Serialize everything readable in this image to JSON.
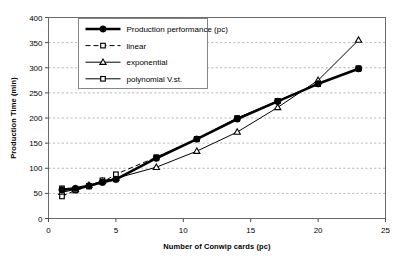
{
  "chart_data": {
    "type": "line",
    "title": "",
    "xlabel": "Number of Conwip cards (pc)",
    "ylabel": "Production Time (min)",
    "xlim": [
      0,
      25
    ],
    "ylim": [
      0,
      400
    ],
    "xticks": [
      0,
      5,
      10,
      15,
      20,
      25
    ],
    "yticks": [
      0,
      50,
      100,
      150,
      200,
      250,
      300,
      350,
      400
    ],
    "grid": "horizontal-dashed",
    "legend_position": "top-left-inside",
    "x": [
      1,
      2,
      3,
      4,
      5,
      8,
      11,
      14,
      17,
      20,
      23
    ],
    "series": [
      {
        "name": "Production performance (pc)",
        "marker": "filled-circle",
        "line": "thick-solid",
        "color": "#000000",
        "values": [
          57,
          60,
          65,
          72,
          78,
          120,
          158,
          198,
          233,
          268,
          298
        ]
      },
      {
        "name": "linear",
        "marker": "open-square",
        "line": "dashed",
        "color": "#000000",
        "values": [
          44,
          56,
          64,
          72,
          88,
          122,
          158,
          198,
          234,
          268,
          299
        ]
      },
      {
        "name": "exponential",
        "marker": "open-triangle",
        "line": "thin-solid",
        "color": "#000000",
        "values": [
          52,
          58,
          66,
          74,
          80,
          102,
          134,
          172,
          221,
          275,
          355
        ]
      },
      {
        "name": "polynomial V.st.",
        "marker": "open-square",
        "line": "thin-solid",
        "color": "#000000",
        "values": [
          60,
          56,
          64,
          76,
          78,
          120,
          158,
          200,
          234,
          268,
          298
        ]
      }
    ]
  },
  "axes": {
    "y_title": "Production Time (min)",
    "x_title": "Number of Conwip cards (pc)",
    "y_ticks": [
      "0",
      "50",
      "100",
      "150",
      "200",
      "250",
      "300",
      "350",
      "400"
    ],
    "x_ticks": [
      "0",
      "5",
      "10",
      "15",
      "20",
      "25"
    ]
  },
  "legend": {
    "items": [
      {
        "label": "Production performance (pc)",
        "marker": "filled-circle",
        "line": "thick-solid"
      },
      {
        "label": "linear",
        "marker": "open-square",
        "line": "dashed"
      },
      {
        "label": "exponential",
        "marker": "open-triangle",
        "line": "thin-solid"
      },
      {
        "label": "polynomial V.st.",
        "marker": "open-square",
        "line": "thin-solid"
      }
    ]
  },
  "caption": {
    "text": ""
  }
}
